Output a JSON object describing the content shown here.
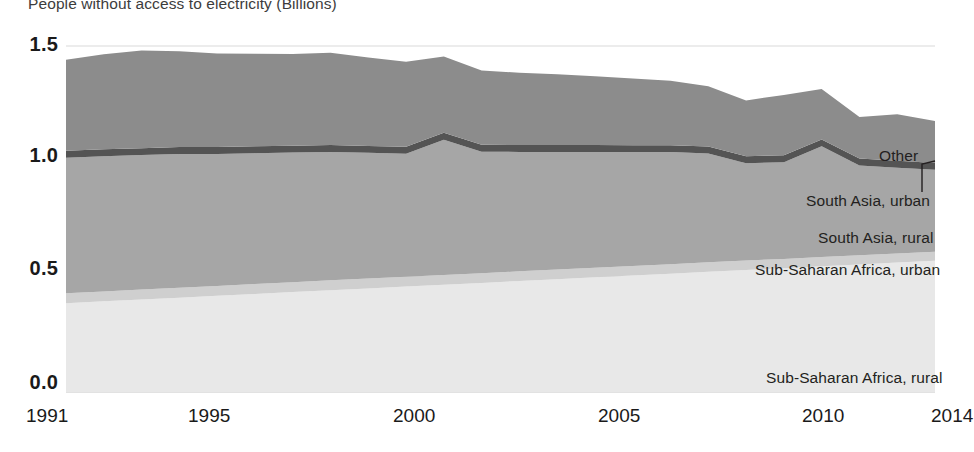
{
  "chart_data": {
    "type": "area",
    "title": "People without access to electricity (Billions)",
    "xlabel": "",
    "ylabel": "",
    "stacked": true,
    "grid": true,
    "legend_position": "inline-right",
    "xlim": [
      1991,
      2014
    ],
    "ylim": [
      0.0,
      1.5
    ],
    "yticks": [
      "0.0",
      "0.5",
      "1.0",
      "1.5"
    ],
    "ytick_values": [
      0.0,
      0.5,
      1.0,
      1.5
    ],
    "xticks": [
      "1991",
      "1995",
      "2000",
      "2005",
      "2010",
      "2014"
    ],
    "xtick_values": [
      1991,
      1995,
      2000,
      2005,
      2010,
      2014
    ],
    "x": [
      1991,
      1992,
      1993,
      1994,
      1995,
      1996,
      1997,
      1998,
      1999,
      2000,
      2001,
      2002,
      2003,
      2004,
      2005,
      2006,
      2007,
      2008,
      2009,
      2010,
      2011,
      2012,
      2013,
      2014
    ],
    "series": [
      {
        "name": "Sub-Saharan Africa, rural",
        "color": "#e8e8e8",
        "values": [
          0.385,
          0.393,
          0.401,
          0.409,
          0.417,
          0.425,
          0.433,
          0.441,
          0.449,
          0.457,
          0.465,
          0.473,
          0.481,
          0.489,
          0.497,
          0.505,
          0.513,
          0.521,
          0.529,
          0.537,
          0.545,
          0.553,
          0.561,
          0.569
        ]
      },
      {
        "name": "Sub-Saharan Africa, urban",
        "color": "#cfcfcf",
        "values": [
          0.043,
          0.043,
          0.043,
          0.043,
          0.043,
          0.043,
          0.043,
          0.043,
          0.043,
          0.043,
          0.042,
          0.042,
          0.042,
          0.042,
          0.042,
          0.041,
          0.041,
          0.041,
          0.041,
          0.04,
          0.04,
          0.04,
          0.039,
          0.039
        ]
      },
      {
        "name": "South Asia, rural",
        "color": "#a6a6a6",
        "values": [
          0.588,
          0.586,
          0.583,
          0.58,
          0.572,
          0.567,
          0.562,
          0.557,
          0.545,
          0.533,
          0.587,
          0.527,
          0.518,
          0.51,
          0.502,
          0.494,
          0.486,
          0.472,
          0.422,
          0.419,
          0.48,
          0.389,
          0.372,
          0.355
        ]
      },
      {
        "name": "South Asia, urban",
        "color": "#545454",
        "values": [
          0.03,
          0.03,
          0.03,
          0.03,
          0.03,
          0.03,
          0.03,
          0.03,
          0.03,
          0.03,
          0.03,
          0.03,
          0.03,
          0.03,
          0.03,
          0.03,
          0.03,
          0.03,
          0.03,
          0.03,
          0.03,
          0.03,
          0.03,
          0.03
        ]
      },
      {
        "name": "Other",
        "color": "#8c8c8c",
        "values": [
          0.394,
          0.412,
          0.424,
          0.415,
          0.405,
          0.401,
          0.397,
          0.4,
          0.383,
          0.369,
          0.33,
          0.322,
          0.313,
          0.306,
          0.298,
          0.289,
          0.279,
          0.262,
          0.242,
          0.262,
          0.219,
          0.18,
          0.202,
          0.182
        ]
      }
    ],
    "totals": [
      1.44,
      1.464,
      1.481,
      1.477,
      1.467,
      1.466,
      1.465,
      1.471,
      1.45,
      1.432,
      1.454,
      1.394,
      1.384,
      1.377,
      1.369,
      1.359,
      1.349,
      1.326,
      1.264,
      1.288,
      1.314,
      1.192,
      1.204,
      1.175
    ]
  },
  "series_labels": [
    {
      "text": "Other",
      "x": 879,
      "y": 147
    },
    {
      "text": "South Asia, urban",
      "x": 806,
      "y": 192
    },
    {
      "text": "South Asia, rural",
      "x": 818,
      "y": 229
    },
    {
      "text": "Sub-Saharan Africa, urban",
      "x": 755,
      "y": 261
    },
    {
      "text": "Sub-Saharan Africa, rural",
      "x": 766,
      "y": 369
    }
  ],
  "ytick_positions": [
    {
      "label": "1.5",
      "y": 33
    },
    {
      "label": "1.0",
      "y": 144
    },
    {
      "label": "0.5",
      "y": 257
    },
    {
      "label": "0.0",
      "y": 371
    }
  ],
  "xtick_positions": [
    {
      "label": "1991",
      "x": 26
    },
    {
      "label": "1995",
      "x": 188
    },
    {
      "label": "2000",
      "x": 393
    },
    {
      "label": "2005",
      "x": 598
    },
    {
      "label": "2010",
      "x": 802
    },
    {
      "label": "2014",
      "x": 931
    }
  ],
  "colors": {
    "gridline": "#d9d9d9",
    "background": "#ffffff",
    "text": "#1a1a1a",
    "title": "#3c3c3c"
  }
}
